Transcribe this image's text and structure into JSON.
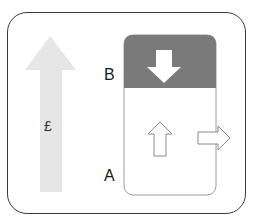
{
  "diagram": {
    "labels": {
      "top": "B",
      "bottom": "A",
      "currency": "£"
    },
    "colors": {
      "frame_border": "#3a3a3a",
      "big_arrow_fill": "#e6e6e6",
      "box_header_fill": "#7a7a7a",
      "box_border": "#9a9a9a",
      "small_arrow_stroke": "#8a8a8a",
      "down_arrow_fill": "#ffffff"
    },
    "icons": {
      "big_arrow": "arrow-up-icon",
      "down_arrow": "arrow-down-icon",
      "small_up_arrow": "arrow-up-outline-icon",
      "small_right_arrow": "arrow-right-outline-icon"
    }
  }
}
